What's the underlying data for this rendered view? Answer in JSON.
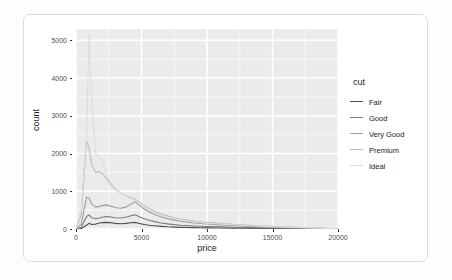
{
  "card": {
    "name": "plot-card"
  },
  "chart_data": {
    "type": "line",
    "title": "",
    "subtitle": "",
    "xlabel": "price",
    "ylabel": "count",
    "xlim": [
      0,
      20000
    ],
    "ylim": [
      0,
      5300
    ],
    "grid": true,
    "legend": {
      "title": "cut",
      "position": "right",
      "entries": [
        "Fair",
        "Good",
        "Very Good",
        "Premium",
        "Ideal"
      ]
    },
    "xticks": [
      0,
      5000,
      10000,
      15000,
      20000
    ],
    "xtick_labels": [
      "0",
      "5000",
      "10000",
      "15000",
      "20000"
    ],
    "yticks": [
      0,
      1000,
      2000,
      3000,
      4000,
      5000
    ],
    "ytick_labels": [
      "0",
      "1000",
      "2000",
      "3000",
      "4000",
      "5000"
    ],
    "colors": {
      "Fair": "#4d4d4d",
      "Good": "#7a7a7a",
      "Very Good": "#9c9c9c",
      "Premium": "#bcbcbc",
      "Ideal": "#dcdcdc"
    },
    "panel_background": "#ebebeb",
    "grid_color": "#ffffff",
    "x": [
      0,
      400,
      800,
      1000,
      1200,
      1500,
      1800,
      2000,
      2300,
      2600,
      3000,
      3400,
      3800,
      4200,
      4500,
      4800,
      5200,
      5600,
      6000,
      6500,
      7000,
      7500,
      8000,
      8500,
      9000,
      9500,
      10000,
      11000,
      12000,
      13000,
      14000,
      15000,
      16000,
      17000,
      18000,
      19000,
      20000
    ],
    "series": [
      {
        "name": "Fair",
        "color": "#4d4d4d",
        "values": [
          0,
          10,
          100,
          150,
          120,
          130,
          160,
          170,
          175,
          170,
          150,
          140,
          150,
          165,
          175,
          150,
          120,
          100,
          85,
          70,
          58,
          50,
          44,
          40,
          36,
          32,
          30,
          25,
          22,
          18,
          15,
          12,
          10,
          8,
          6,
          4,
          0
        ]
      },
      {
        "name": "Good",
        "color": "#7a7a7a",
        "values": [
          0,
          40,
          330,
          370,
          300,
          270,
          290,
          310,
          330,
          320,
          300,
          290,
          310,
          350,
          375,
          330,
          270,
          230,
          195,
          160,
          135,
          115,
          100,
          90,
          80,
          72,
          65,
          55,
          45,
          38,
          30,
          25,
          20,
          16,
          12,
          8,
          0
        ]
      },
      {
        "name": "Very Good",
        "color": "#9c9c9c",
        "values": [
          0,
          130,
          840,
          820,
          660,
          580,
          600,
          620,
          640,
          610,
          570,
          550,
          580,
          660,
          720,
          640,
          530,
          450,
          385,
          320,
          270,
          235,
          205,
          182,
          162,
          146,
          132,
          110,
          92,
          76,
          62,
          50,
          40,
          32,
          24,
          15,
          0
        ]
      },
      {
        "name": "Premium",
        "color": "#bcbcbc",
        "values": [
          0,
          380,
          2330,
          2150,
          1700,
          1500,
          1520,
          1480,
          1350,
          1200,
          1050,
          950,
          880,
          830,
          800,
          720,
          620,
          540,
          470,
          400,
          345,
          300,
          265,
          236,
          212,
          192,
          175,
          148,
          124,
          104,
          86,
          70,
          56,
          44,
          33,
          20,
          0
        ]
      },
      {
        "name": "Ideal",
        "color": "#dcdcdc",
        "values": [
          0,
          520,
          2450,
          5150,
          3400,
          2000,
          1900,
          1820,
          1480,
          1250,
          1080,
          960,
          870,
          800,
          760,
          680,
          580,
          500,
          430,
          365,
          312,
          270,
          238,
          212,
          190,
          172,
          157,
          132,
          111,
          93,
          77,
          62,
          50,
          39,
          29,
          18,
          0
        ]
      }
    ]
  }
}
